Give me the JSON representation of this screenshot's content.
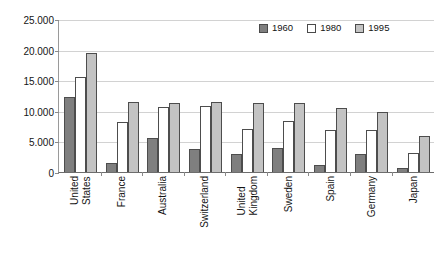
{
  "chart_data": {
    "type": "bar",
    "title": "",
    "subtitle": "",
    "xlabel": "",
    "ylabel": "",
    "ylim": [
      0,
      25000
    ],
    "grid": true,
    "legend_position": "top-right",
    "y_ticks": [
      "0",
      "5.000",
      "10.000",
      "15.000",
      "20.000",
      "25.000"
    ],
    "y_tick_values": [
      0,
      5000,
      10000,
      15000,
      20000,
      25000
    ],
    "categories": [
      "United States",
      "France",
      "Australia",
      "Switzerland",
      "United Kingdom",
      "Sweden",
      "Spain",
      "Germany",
      "Japan"
    ],
    "category_lines": [
      [
        "United",
        "States"
      ],
      [
        "France",
        ""
      ],
      [
        "Australia",
        ""
      ],
      [
        "Switzerland",
        ""
      ],
      [
        "United",
        "Kingdom"
      ],
      [
        "Sweden",
        ""
      ],
      [
        "Spain",
        ""
      ],
      [
        "Germany",
        ""
      ],
      [
        "Japan",
        ""
      ]
    ],
    "series": [
      {
        "name": "1960",
        "color": "#7f7f7f",
        "values": [
          12300,
          1500,
          5500,
          3700,
          3000,
          3900,
          1100,
          3000,
          700
        ]
      },
      {
        "name": "1980",
        "color": "#ffffff",
        "values": [
          15500,
          8200,
          10600,
          10800,
          7000,
          8400,
          6900,
          6900,
          3100
        ]
      },
      {
        "name": "1995",
        "color": "#c3c3c3",
        "values": [
          19500,
          11500,
          11300,
          11400,
          11300,
          11300,
          10500,
          9800,
          5900
        ]
      }
    ]
  },
  "legend": {
    "items": [
      {
        "label": "1960",
        "color": "#7f7f7f"
      },
      {
        "label": "1980",
        "color": "#ffffff"
      },
      {
        "label": "1995",
        "color": "#c3c3c3"
      }
    ]
  }
}
